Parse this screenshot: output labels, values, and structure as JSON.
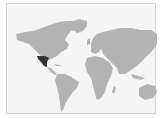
{
  "map": {
    "type": "world-choropleth",
    "highlighted_region": "Mexico",
    "colors": {
      "background": "#f5f5f5",
      "border": "#d4d4d4",
      "land": "#b3b3b3",
      "highlight": "#333333"
    }
  }
}
